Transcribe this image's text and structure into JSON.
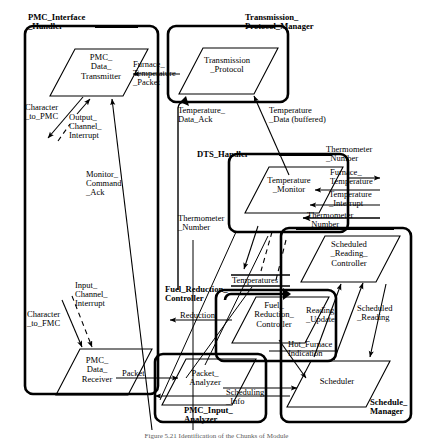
{
  "diagram": {
    "type": "dataflow-architecture-diagram",
    "caption": "Figure 5.21   Identification of the Chunks of Module",
    "stroke_color": "#000000",
    "background_color": "#ffffff",
    "subsystems": [
      {
        "id": "pmc_interface_handler",
        "label": "PMC_Interface\n_Handler"
      },
      {
        "id": "transmission_protocol_manager",
        "label": "Transmission_\nProtocol_Manager"
      },
      {
        "id": "dts_handler",
        "label": "DTS_Handler"
      },
      {
        "id": "fuel_reduction_controller",
        "label": "Fuel_Reduction_\nController"
      },
      {
        "id": "pmc_input_analyzer",
        "label": "PMC_Input_\nAnalyzer"
      },
      {
        "id": "schedule_manager",
        "label": "Schedule_\nManager"
      }
    ],
    "processes": [
      {
        "id": "pmc_data_transmitter",
        "label": "PMC_\nData_\nTransmitter"
      },
      {
        "id": "transmission_protocol",
        "label": "Transmission\n_Protocol"
      },
      {
        "id": "temperature_monitor",
        "label": "Temperature\n_Monitor"
      },
      {
        "id": "scheduled_reading_controller",
        "label": "Scheduled\n_Reading_\nController"
      },
      {
        "id": "fuel_reduction_controller_proc",
        "label": "Fuel_\nReduction_\nController"
      },
      {
        "id": "pmc_data_receiver",
        "label": "PMC_\nData_\nReceiver"
      },
      {
        "id": "packet_analyzer",
        "label": "Packet_\nAnalyzer"
      },
      {
        "id": "scheduler",
        "label": "Scheduler"
      }
    ],
    "flows": [
      {
        "id": "character_to_pmc",
        "label": "Character\n_to_PMC"
      },
      {
        "id": "output_channel_interrupt",
        "label": "Output_\nChannel_\nInterrupt"
      },
      {
        "id": "furnace_temperature_packet",
        "label": "Furnace_\nTemperature\n_Packet"
      },
      {
        "id": "temperature_data_ack",
        "label": "Temperature_\nData_Ack"
      },
      {
        "id": "temperature_data_buffered",
        "label": "Temperature\n_Data (buffered)"
      },
      {
        "id": "monitor_command_ack",
        "label": "Monitor_\nCommand\n_Ack"
      },
      {
        "id": "thermometer_number_top",
        "label": "Thermometer\n_Number"
      },
      {
        "id": "furnace_temperature",
        "label": "Furnace_\nTemperature"
      },
      {
        "id": "temperature_interrupt",
        "label": "Temperature\n_Interrupt"
      },
      {
        "id": "thermometer_number_mid",
        "label": "Thermometer\n_Number"
      },
      {
        "id": "thermometer_number_left",
        "label": "Thermometer\n_Number"
      },
      {
        "id": "temperatures",
        "label": "Temperatures"
      },
      {
        "id": "reduction",
        "label": "Reduction"
      },
      {
        "id": "reading_update",
        "label": "Reading\n_Update"
      },
      {
        "id": "scheduled_reading",
        "label": "Scheduled\n_Reading"
      },
      {
        "id": "hot_furnace_indication",
        "label": "Hot_Furnace\nIndication"
      },
      {
        "id": "input_channel_interrupt",
        "label": "Input_\nChannel_\nInterrupt"
      },
      {
        "id": "character_to_fmc",
        "label": "Character\n_to_FMC"
      },
      {
        "id": "packet",
        "label": "Packet"
      },
      {
        "id": "scheduling_info",
        "label": "Scheduling\n_Info"
      }
    ]
  }
}
